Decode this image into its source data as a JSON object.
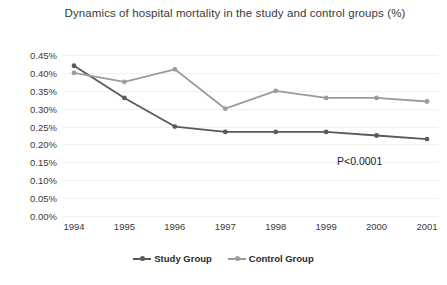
{
  "chart_data": {
    "type": "line",
    "title": "Dynamics of hospital mortality in the study and control groups (%)",
    "xlabel": "",
    "ylabel": "",
    "categories": [
      "1994",
      "1995",
      "1996",
      "1997",
      "1998",
      "1999",
      "2000",
      "2001"
    ],
    "series": [
      {
        "name": "Study Group",
        "color": "#595959",
        "values": [
          0.42,
          0.33,
          0.25,
          0.235,
          0.235,
          0.235,
          0.225,
          0.215
        ]
      },
      {
        "name": "Control Group",
        "color": "#9c9c9c",
        "values": [
          0.4,
          0.375,
          0.41,
          0.3,
          0.35,
          0.33,
          0.33,
          0.32
        ]
      }
    ],
    "ylim": [
      0.0,
      0.45
    ],
    "ytick_labels": [
      "0.45%",
      "0.40%",
      "0.35%",
      "0.30%",
      "0.25%",
      "0.20%",
      "0.15%",
      "0.10%",
      "0.05%",
      "0.00%"
    ],
    "ytick_values": [
      0.45,
      0.4,
      0.35,
      0.3,
      0.25,
      0.2,
      0.15,
      0.1,
      0.05,
      0.0
    ],
    "grid": true,
    "grid_color": "#f0f0f0",
    "legend_position": "bottom",
    "annotations": [
      {
        "text": "P<0.0001",
        "x": 337,
        "y": 155
      }
    ],
    "background": "#ffffff"
  }
}
